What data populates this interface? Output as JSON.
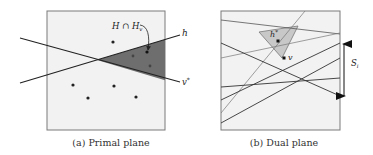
{
  "figure": {
    "panels": [
      {
        "id": "primal",
        "caption": "(a) Primal plane",
        "box": {
          "x": 47,
          "y": 11,
          "w": 118,
          "h": 119,
          "fill": "#f2f2f2",
          "stroke": "#7a7a7a"
        },
        "lines": [
          {
            "name": "h",
            "label": "h",
            "x1": 20,
            "y1": 83,
            "x2": 180,
            "y2": 35
          },
          {
            "name": "v-star",
            "label": "v*",
            "x1": 20,
            "y1": 38,
            "x2": 180,
            "y2": 82
          }
        ],
        "shaded_region": {
          "label": "H ∩ H_v",
          "fill": "#6e6e6e"
        },
        "points": [
          {
            "x": 113,
            "y": 42
          },
          {
            "x": 133,
            "y": 56
          },
          {
            "x": 147,
            "y": 52
          },
          {
            "x": 150,
            "y": 66
          },
          {
            "x": 73,
            "y": 85
          },
          {
            "x": 114,
            "y": 86
          },
          {
            "x": 88,
            "y": 98
          },
          {
            "x": 136,
            "y": 97
          }
        ],
        "annotation": {
          "text_main": "H ∩ H",
          "text_sub": "v"
        }
      },
      {
        "id": "dual",
        "caption": "(b) Dual plane",
        "box": {
          "x": 221,
          "y": 11,
          "w": 119,
          "h": 119,
          "fill": "#f2f2f2",
          "stroke": "#7a7a7a"
        },
        "triangle": {
          "fill": "#c8c8c8",
          "stroke": "#777777"
        },
        "points": [
          {
            "name": "h-star",
            "label": "h*",
            "x": 278,
            "y": 41
          },
          {
            "name": "v",
            "label": "v",
            "x": 284,
            "y": 58
          }
        ],
        "range_arrow": {
          "label_main": "S",
          "label_sub": "i",
          "x": 344,
          "y1": 42,
          "y2": 98
        }
      }
    ]
  },
  "labels": {
    "primal_caption": "(a) Primal plane",
    "dual_caption": "(b) Dual plane",
    "h": "h",
    "v_star_main": "v",
    "v_star_sup": "*",
    "intersection_main": "H ∩ H",
    "intersection_sub": "v",
    "h_star_main": "h",
    "h_star_sup": "*",
    "v": "v",
    "s_main": "S",
    "s_sub": "i"
  }
}
